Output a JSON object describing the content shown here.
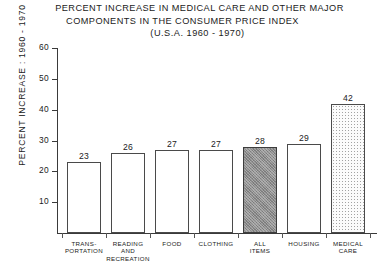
{
  "title": {
    "line1": "PERCENT INCREASE IN MEDICAL CARE AND OTHER  MAJOR",
    "line2": "COMPONENTS IN THE CONSUMER PRICE INDEX",
    "line3": "(U.S.A.  1960 - 1970)"
  },
  "axes": {
    "y_title": "PERCENT INCREASE : 1960 - 1970",
    "y_ticks": [
      "60",
      "50",
      "40",
      "30",
      "20",
      "10"
    ]
  },
  "chart_data": {
    "type": "bar",
    "title": "PERCENT INCREASE IN MEDICAL CARE AND OTHER MAJOR COMPONENTS IN THE CONSUMER PRICE INDEX (U.S.A. 1960 - 1970)",
    "xlabel": "",
    "ylabel": "PERCENT INCREASE : 1960 - 1970",
    "ylim": [
      0,
      60
    ],
    "yticks": [
      10,
      20,
      30,
      40,
      50,
      60
    ],
    "grid": false,
    "legend": "none",
    "categories": [
      "TRANS-PORTATION",
      "READING AND RECREATION",
      "FOOD",
      "CLOTHING",
      "ALL ITEMS",
      "HOUSING",
      "MEDICAL CARE"
    ],
    "values": [
      23,
      26,
      27,
      27,
      28,
      29,
      42
    ],
    "bars": [
      {
        "label_lines": [
          "TRANS-",
          "PORTATION"
        ],
        "value": 23,
        "value_label": "23",
        "fill": "open"
      },
      {
        "label_lines": [
          "READING",
          "AND",
          "RECREATION"
        ],
        "value": 26,
        "value_label": "26",
        "fill": "open"
      },
      {
        "label_lines": [
          "FOOD"
        ],
        "value": 27,
        "value_label": "27",
        "fill": "open"
      },
      {
        "label_lines": [
          "CLOTHING"
        ],
        "value": 27,
        "value_label": "27",
        "fill": "open"
      },
      {
        "label_lines": [
          "ALL",
          "ITEMS"
        ],
        "value": 28,
        "value_label": "28",
        "fill": "dark"
      },
      {
        "label_lines": [
          "HOUSING"
        ],
        "value": 29,
        "value_label": "29",
        "fill": "open"
      },
      {
        "label_lines": [
          "MEDICAL",
          "CARE"
        ],
        "value": 42,
        "value_label": "42",
        "fill": "stipple"
      }
    ]
  },
  "colors": {
    "background": "#ffffff",
    "ink": "#1b1b1b",
    "axis": "#3a3a3a",
    "bar_outline": "#4a4a4a",
    "bar_dark_fill": "#8d8d8d",
    "bar_stipple_fill": "#fbfbfb"
  }
}
